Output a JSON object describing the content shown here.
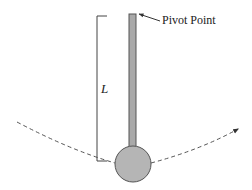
{
  "diagram": {
    "labels": {
      "pivot": "Pivot Point",
      "length": "L"
    },
    "elements": {
      "rod": "rod",
      "bob": "bob",
      "length_bracket": "bracket",
      "swing_path": "dashed arc with arrow pointing right"
    },
    "colors": {
      "rod_fill": "#a9a9a9",
      "bob_fill": "#b5b5b5",
      "stroke": "#555555",
      "text": "#222222",
      "background": "#ffffff"
    }
  }
}
